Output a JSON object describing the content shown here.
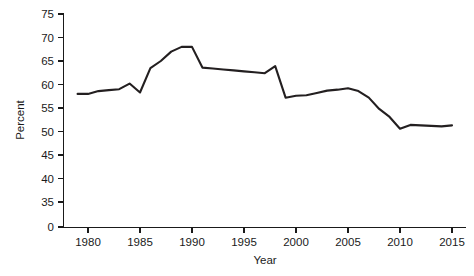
{
  "chart_data": {
    "type": "line",
    "title": "",
    "xlabel": "Year",
    "ylabel": "Percent",
    "xlim": [
      1977,
      2017
    ],
    "ylim": [
      33,
      76
    ],
    "grid": false,
    "legend": null,
    "x_ticks": [
      1980,
      1985,
      1990,
      1995,
      2000,
      2005,
      2010,
      2015
    ],
    "x_tick_labels": [
      "1980",
      "1985",
      "1990",
      "1995",
      "2000",
      "2005",
      "2010",
      "2015"
    ],
    "y_ticks": [
      0,
      35,
      40,
      45,
      50,
      55,
      60,
      65,
      70,
      75
    ],
    "y_tick_labels": [
      "0",
      "35",
      "40",
      "45",
      "50",
      "55",
      "60",
      "65",
      "70",
      "75"
    ],
    "y_axis_break": true,
    "y_axis_break_note": "axis broken between 0 and 35",
    "line_color": "#231f20",
    "series": [
      {
        "name": "Percent",
        "x": [
          1979,
          1980,
          1981,
          1982,
          1983,
          1984,
          1985,
          1986,
          1987,
          1988,
          1989,
          1990,
          1991,
          1992,
          1993,
          1994,
          1995,
          1996,
          1997,
          1998,
          1999,
          2000,
          2001,
          2002,
          2003,
          2004,
          2005,
          2006,
          2007,
          2008,
          2009,
          2010,
          2011,
          2012,
          2013,
          2014,
          2015
        ],
        "values": [
          58.0,
          58.0,
          58.6,
          58.8,
          59.0,
          60.2,
          58.3,
          63.5,
          65.0,
          67.0,
          68.0,
          68.0,
          63.6,
          63.4,
          63.2,
          63.0,
          62.8,
          62.6,
          62.4,
          63.9,
          57.2,
          57.6,
          57.7,
          58.2,
          58.7,
          58.9,
          59.2,
          58.6,
          57.2,
          54.8,
          53.1,
          50.6,
          51.4,
          51.3,
          51.2,
          51.1,
          51.3
        ]
      }
    ]
  },
  "axis": {
    "x_title": "Year",
    "y_title": "Percent"
  },
  "colors": {
    "line": "#231f20",
    "axis": "#1a1a1a",
    "background": "#ffffff"
  }
}
